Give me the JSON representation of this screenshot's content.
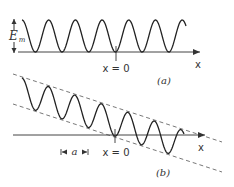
{
  "panels": [
    {
      "id": "a",
      "caption": "(a)",
      "axis_label": "x",
      "origin_label": "x = 0",
      "amplitude_label": "E",
      "amplitude_subscript": "m",
      "description": "Uniform sinusoidal wave with constant amplitude above the x-axis"
    },
    {
      "id": "b",
      "caption": "(b)",
      "axis_label": "x",
      "origin_label": "x = 0",
      "spacing_label": "a",
      "description": "Sinusoidal wave with linearly decreasing envelope bounded by two dashed lines"
    }
  ],
  "colors": {
    "stroke": "#222222",
    "dashed": "#555555",
    "axis": "#444444"
  }
}
